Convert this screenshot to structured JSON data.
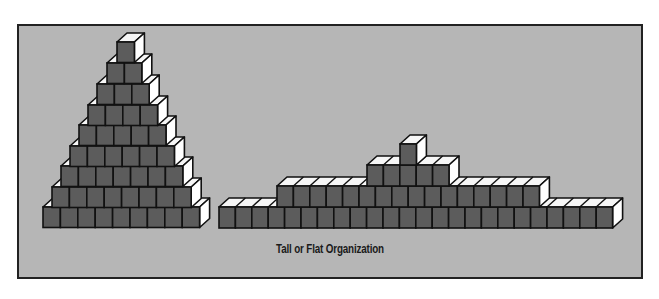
{
  "caption": "Tall or Flat Organization",
  "colors": {
    "background": "#b6b6b6",
    "block_face": "#5c5c5c",
    "block_top": "#f6f6f6",
    "block_side": "#ffffff",
    "outline": "#111111"
  },
  "block": {
    "depth_x": 10,
    "depth_y": 9
  },
  "structures": [
    {
      "name": "tall-organization",
      "block_width": 17.4,
      "row_height": 20.5,
      "rows": [
        {
          "x": 43,
          "y": 207,
          "count": 9
        },
        {
          "x": 52,
          "y": 187,
          "count": 8
        },
        {
          "x": 61,
          "y": 166,
          "count": 7
        },
        {
          "x": 70,
          "y": 146,
          "count": 6
        },
        {
          "x": 79,
          "y": 125,
          "count": 5
        },
        {
          "x": 88,
          "y": 105,
          "count": 4
        },
        {
          "x": 97,
          "y": 84,
          "count": 3
        },
        {
          "x": 107,
          "y": 63,
          "count": 2
        },
        {
          "x": 117,
          "y": 42,
          "count": 1
        }
      ]
    },
    {
      "name": "flat-organization",
      "block_width": 16.4,
      "row_height": 21,
      "rows": [
        {
          "x": 219,
          "y": 207,
          "count": 24
        },
        {
          "x": 277,
          "y": 186,
          "count": 16
        },
        {
          "x": 367,
          "y": 165,
          "count": 5
        },
        {
          "x": 400,
          "y": 144,
          "count": 1
        }
      ]
    }
  ]
}
